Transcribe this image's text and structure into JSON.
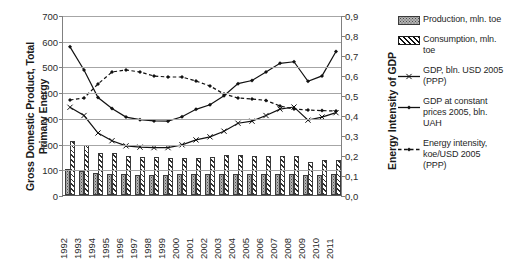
{
  "chart_data": {
    "type": "bar",
    "title": "",
    "subtitle": "",
    "xlabel": "",
    "ylabel": "Gross Domestic Product, Total Primary Energy",
    "y2label": "Energy Intensity of GDP",
    "ylim": [
      0,
      700
    ],
    "y2lim": [
      0.0,
      0.9
    ],
    "grid": true,
    "legend_position": "right",
    "decimal_separator": ",",
    "categories": [
      "1992",
      "1993",
      "1994",
      "1995",
      "1996",
      "1997",
      "1998",
      "1999",
      "2000",
      "2001",
      "2002",
      "2003",
      "2004",
      "2005",
      "2006",
      "2007",
      "2008",
      "2009",
      "2010",
      "2011"
    ],
    "y_ticks": [
      "0",
      "100",
      "200",
      "300",
      "400",
      "500",
      "600",
      "700"
    ],
    "y2_ticks": [
      "0,0",
      "0,1",
      "0,2",
      "0,3",
      "0,4",
      "0,5",
      "0,6",
      "0,7",
      "0,8",
      "0,9"
    ],
    "series": [
      {
        "name": "Production, mln. toe",
        "kind": "bar",
        "axis": "left",
        "pattern": "dotted",
        "values": [
          100,
          92,
          85,
          82,
          80,
          78,
          78,
          79,
          80,
          81,
          82,
          83,
          83,
          82,
          80,
          80,
          81,
          76,
          78,
          82
        ]
      },
      {
        "name": "Consumption, mln. toe",
        "kind": "bar",
        "axis": "left",
        "pattern": "diagonal-hatch",
        "values": [
          210,
          196,
          163,
          164,
          151,
          149,
          147,
          143,
          144,
          144,
          146,
          154,
          156,
          153,
          150,
          153,
          150,
          127,
          136,
          136
        ]
      },
      {
        "name": "GDP, bln. USD 2005 (PPP)",
        "kind": "line",
        "axis": "left",
        "marker": "x",
        "style": "solid",
        "values": [
          345,
          313,
          245,
          215,
          195,
          190,
          188,
          188,
          199,
          218,
          230,
          252,
          283,
          291,
          313,
          338,
          346,
          295,
          307,
          324
        ]
      },
      {
        "name": "GDP at constant prices 2005, bln. UAH",
        "kind": "line",
        "axis": "left",
        "marker": "filled-diamond",
        "style": "solid",
        "values": [
          580,
          490,
          383,
          340,
          307,
          297,
          292,
          291,
          308,
          337,
          355,
          390,
          437,
          449,
          482,
          516,
          522,
          446,
          467,
          562
        ]
      },
      {
        "name": "Energy intensity, koe/USD 2005 (PPP)",
        "kind": "line",
        "axis": "right",
        "marker": "filled-diamond",
        "style": "dashed",
        "values": [
          0.48,
          0.49,
          0.56,
          0.62,
          0.63,
          0.62,
          0.6,
          0.595,
          0.595,
          0.575,
          0.55,
          0.51,
          0.49,
          0.485,
          0.478,
          0.45,
          0.435,
          0.43,
          0.427,
          0.425
        ]
      }
    ]
  },
  "legend": {
    "entries": [
      {
        "label": "Production, mln. toe",
        "swatch": "bar-dotted"
      },
      {
        "label": "Consumption, mln. toe",
        "swatch": "bar-hatched"
      },
      {
        "label": "GDP, bln. USD 2005 (PPP)",
        "swatch": "line-x"
      },
      {
        "label": "GDP at constant prices 2005, bln. UAH",
        "swatch": "line-diamond"
      },
      {
        "label": "Energy intensity, koe/USD 2005 (PPP)",
        "swatch": "line-dashed-diamond"
      }
    ]
  },
  "axes": {
    "left_title": "Gross Domestic Product, Total Primary Energy",
    "right_title": "Energy Intensity of GDP"
  }
}
